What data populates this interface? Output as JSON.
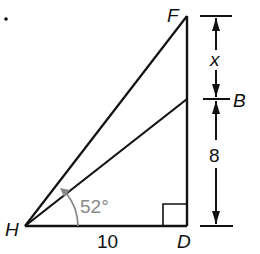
{
  "problem": {
    "number_fragment": "."
  },
  "points": {
    "H": {
      "label": "H",
      "x": 25,
      "y": 226
    },
    "D": {
      "label": "D",
      "x": 187,
      "y": 226
    },
    "F": {
      "label": "F",
      "x": 187,
      "y": 16
    },
    "B": {
      "label": "B",
      "x": 187,
      "y": 99
    }
  },
  "labels": {
    "angle": "52°",
    "base": "10",
    "upper_segment": "x",
    "lower_segment": "8"
  },
  "colors": {
    "line": "#111111",
    "angle_arc": "#888888"
  }
}
